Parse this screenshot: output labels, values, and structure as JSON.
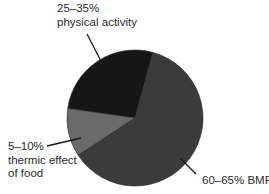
{
  "chart_data": {
    "type": "pie",
    "title": "",
    "slices": [
      {
        "name": "physical activity",
        "label_range": "25–35%",
        "label_text": "physical activity",
        "value": 27,
        "color": "#161616"
      },
      {
        "name": "thermic effect of food",
        "label_range": "5–10%",
        "label_text_line1": "thermic effect",
        "label_text_line2": "of food",
        "value": 11.5,
        "color": "#6a6a6a"
      },
      {
        "name": "BMR",
        "label_range": "60–65%",
        "label_text": "BMR",
        "label_full": "60–65% BMR",
        "value": 61.5,
        "color": "#3b3b3b"
      }
    ],
    "legend": "none (direct labels with leader lines)",
    "center": [
      135,
      118
    ],
    "radius": 68
  },
  "labels": {
    "physical_activity": {
      "line1": "25–35%",
      "line2": "physical activity"
    },
    "thermic": {
      "line1": "5–10%",
      "line2": "thermic effect",
      "line3": "of food"
    },
    "bmr": {
      "line1": "60–65% BMR"
    }
  }
}
